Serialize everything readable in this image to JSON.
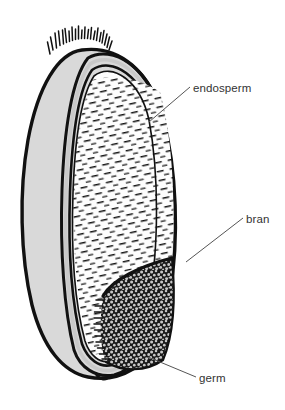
{
  "figure": {
    "background_color": "#ffffff"
  },
  "colors": {
    "outline": "#111111",
    "hull_fill": "#d9d9d9",
    "endosperm_fill": "#fdfdfd",
    "endosperm_hatch": "#111111",
    "bran_band": "#c9c9c9",
    "germ_fill": "#1a1a1a",
    "germ_speckle": "#c9c9c9",
    "label_text": "#333333",
    "leader_line": "#555555"
  },
  "labels": [
    {
      "id": "endosperm",
      "text": "endosperm",
      "text_x": 193,
      "text_y": 92,
      "leader": {
        "x1": 190,
        "y1": 87,
        "x2": 149,
        "y2": 122
      }
    },
    {
      "id": "bran",
      "text": "bran",
      "text_x": 246,
      "text_y": 223,
      "leader": {
        "x1": 243,
        "y1": 218,
        "x2": 186,
        "y2": 262
      }
    },
    {
      "id": "germ",
      "text": "germ",
      "text_x": 199,
      "text_y": 382,
      "leader": {
        "x1": 196,
        "y1": 377,
        "x2": 148,
        "y2": 357
      }
    }
  ],
  "parts": [
    {
      "id": "brush-hairs",
      "name": "brush hairs",
      "count": 21
    },
    {
      "id": "hull",
      "name": "outer kernel body"
    },
    {
      "id": "bran-layer",
      "name": "bran layer"
    },
    {
      "id": "endosperm-region",
      "name": "endosperm"
    },
    {
      "id": "germ-region",
      "name": "germ"
    }
  ]
}
